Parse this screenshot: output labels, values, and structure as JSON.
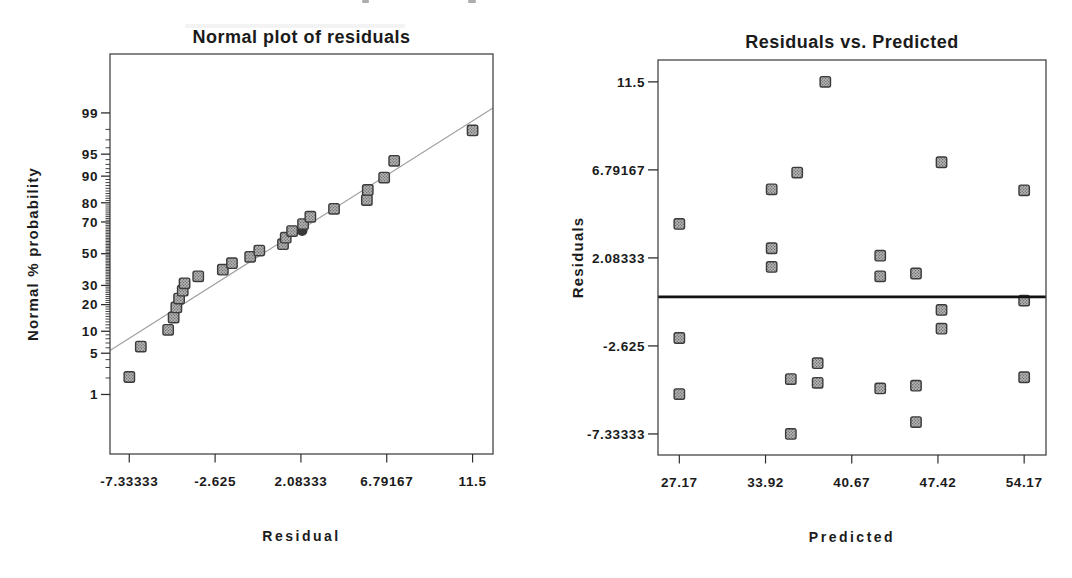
{
  "page": {
    "background": "#ffffff"
  },
  "colors": {
    "text": "#1b1b1b",
    "frame": "#454545",
    "tick": "#2e2e2e",
    "marker_fill": "#b7b7b7",
    "marker_dot": "#6f6f6f",
    "marker_border": "#3b3b3b",
    "overlap_marker": "#383838",
    "fit_line": "#a0a0a0",
    "zero_line": "#121212",
    "artifact": "#6a6a6a"
  },
  "scan_artifacts": [
    {
      "x": 362,
      "y": 0,
      "w": 7,
      "h": 3,
      "opacity": 0.55
    },
    {
      "x": 468,
      "y": 0,
      "w": 8,
      "h": 3,
      "opacity": 0.55
    },
    {
      "x": 185,
      "y": 24,
      "w": 220,
      "h": 4,
      "opacity": 0.08
    }
  ],
  "chart_data": [
    {
      "id": "normal_plot",
      "type": "scatter",
      "title": "Normal plot of residuals",
      "xlabel": "Residual",
      "ylabel": "Normal % probability",
      "grid": false,
      "legend": false,
      "x_ticks": [
        "-7.33333",
        "-2.625",
        "2.08333",
        "6.79167",
        "11.5"
      ],
      "x_tick_values": [
        -7.33333,
        -2.625,
        2.08333,
        6.79167,
        11.5
      ],
      "x_range": [
        -8.39,
        12.62
      ],
      "y_scale": "normal_probability",
      "y_major_ticks": [
        1,
        5,
        10,
        20,
        30,
        50,
        70,
        80,
        90,
        95,
        99
      ],
      "y_minor_tick_percent_step": 1,
      "y_z_range": [
        -3.31,
        3.3
      ],
      "points": [
        {
          "residual": -7.33,
          "probability": 2.08
        },
        {
          "residual": -6.7,
          "probability": 6.25
        },
        {
          "residual": -5.2,
          "probability": 10.42
        },
        {
          "residual": -4.9,
          "probability": 14.58
        },
        {
          "residual": -4.75,
          "probability": 18.75
        },
        {
          "residual": -4.6,
          "probability": 22.92
        },
        {
          "residual": -4.4,
          "probability": 27.08
        },
        {
          "residual": -4.3,
          "probability": 31.25
        },
        {
          "residual": -3.55,
          "probability": 35.42
        },
        {
          "residual": -2.2,
          "probability": 39.58
        },
        {
          "residual": -1.7,
          "probability": 43.75
        },
        {
          "residual": -0.7,
          "probability": 47.92
        },
        {
          "residual": -0.2,
          "probability": 52.08
        },
        {
          "residual": 1.1,
          "probability": 56.25
        },
        {
          "residual": 1.25,
          "probability": 60.42
        },
        {
          "residual": 1.6,
          "probability": 64.58
        },
        {
          "residual": 2.2,
          "probability": 68.75
        },
        {
          "residual": 2.6,
          "probability": 72.92
        },
        {
          "residual": 3.9,
          "probability": 77.08
        },
        {
          "residual": 5.7,
          "probability": 81.25
        },
        {
          "residual": 5.75,
          "probability": 85.42
        },
        {
          "residual": 6.65,
          "probability": 89.58
        },
        {
          "residual": 7.2,
          "probability": 93.75
        },
        {
          "residual": 11.5,
          "probability": 97.92
        }
      ],
      "overlap_marker": {
        "residual": 2.15,
        "probability": 64.9
      },
      "fit_line": {
        "x1": -8.39,
        "p1": 5.5,
        "x2": 12.62,
        "p2": 99.2
      }
    },
    {
      "id": "residuals_vs_predicted",
      "type": "scatter",
      "title": "Residuals vs. Predicted",
      "xlabel": "Predicted",
      "ylabel": "Residuals",
      "grid": false,
      "legend": false,
      "x_ticks": [
        "27.17",
        "33.92",
        "40.67",
        "47.42",
        "54.17"
      ],
      "x_tick_values": [
        27.17,
        33.92,
        40.67,
        47.42,
        54.17
      ],
      "x_range": [
        25.5,
        55.88
      ],
      "y_ticks": [
        "11.5",
        "6.79167",
        "2.08333",
        "-2.625",
        "-7.33333"
      ],
      "y_tick_values": [
        11.5,
        6.79167,
        2.08333,
        -2.625,
        -7.33333
      ],
      "y_range": [
        -8.46,
        12.67
      ],
      "zero_line_value": 0,
      "points": [
        {
          "predicted": 38.6,
          "residual": 11.5
        },
        {
          "predicted": 47.7,
          "residual": 7.2
        },
        {
          "predicted": 36.4,
          "residual": 6.65
        },
        {
          "predicted": 54.17,
          "residual": 5.7
        },
        {
          "predicted": 34.4,
          "residual": 5.75
        },
        {
          "predicted": 27.17,
          "residual": 3.9
        },
        {
          "predicted": 34.4,
          "residual": 2.6
        },
        {
          "predicted": 42.9,
          "residual": 2.2
        },
        {
          "predicted": 34.4,
          "residual": 1.6
        },
        {
          "predicted": 45.7,
          "residual": 1.25
        },
        {
          "predicted": 42.9,
          "residual": 1.1
        },
        {
          "predicted": 54.17,
          "residual": -0.2
        },
        {
          "predicted": 47.7,
          "residual": -0.7
        },
        {
          "predicted": 47.7,
          "residual": -1.7
        },
        {
          "predicted": 27.17,
          "residual": -2.2
        },
        {
          "predicted": 38.0,
          "residual": -3.55
        },
        {
          "predicted": 54.17,
          "residual": -4.3
        },
        {
          "predicted": 35.9,
          "residual": -4.4
        },
        {
          "predicted": 38.0,
          "residual": -4.6
        },
        {
          "predicted": 45.7,
          "residual": -4.75
        },
        {
          "predicted": 42.9,
          "residual": -4.9
        },
        {
          "predicted": 27.17,
          "residual": -5.2
        },
        {
          "predicted": 45.7,
          "residual": -6.7
        },
        {
          "predicted": 35.9,
          "residual": -7.33
        }
      ]
    }
  ]
}
